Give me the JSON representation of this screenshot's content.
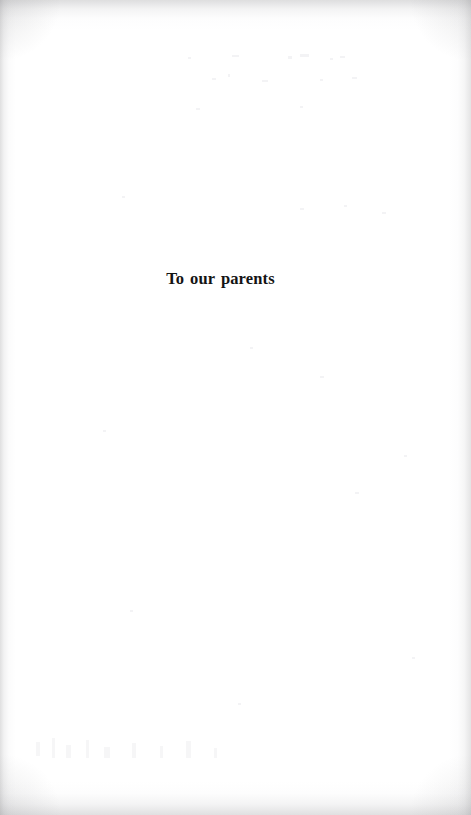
{
  "document": {
    "page_type": "dedication",
    "background_color": "#ffffff",
    "ink_color": "#141414"
  },
  "dedication": {
    "text": "To our parents"
  },
  "scan_artifacts": {
    "edge_shadow_color": "#969698",
    "left_edge": true,
    "right_edge": true,
    "top_edge": true,
    "bottom_edge": true
  }
}
